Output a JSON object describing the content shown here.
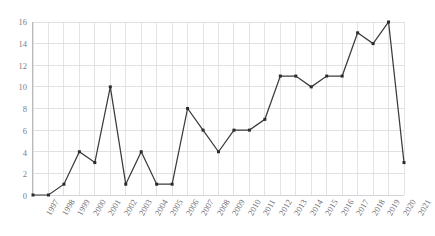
{
  "chart_data": {
    "type": "line",
    "title": "",
    "subtitle": "",
    "xlabel": "",
    "ylabel": "",
    "categories": [
      "1997",
      "1998",
      "1999",
      "2000",
      "2001",
      "2002",
      "2003",
      "2004",
      "2005",
      "2006",
      "2007",
      "2008",
      "2009",
      "2010",
      "2011",
      "2012",
      "2013",
      "2014",
      "2015",
      "2016",
      "2017",
      "2018",
      "2019",
      "2020",
      "2021"
    ],
    "values": [
      0,
      0,
      1,
      4,
      3,
      10,
      1,
      4,
      1,
      1,
      8,
      6,
      4,
      6,
      6,
      7,
      11,
      11,
      10,
      11,
      11,
      15,
      14,
      16,
      3
    ],
    "series": [
      {
        "name": "",
        "values": [
          0,
          0,
          1,
          4,
          3,
          10,
          1,
          4,
          1,
          1,
          8,
          6,
          4,
          6,
          6,
          7,
          11,
          11,
          10,
          11,
          11,
          15,
          14,
          16,
          3
        ]
      }
    ],
    "ylim": [
      0,
      16
    ],
    "ytick_step": 2,
    "ytick_labels": [
      "0",
      "2",
      "4",
      "6",
      "8",
      "10",
      "12",
      "14",
      "16"
    ],
    "xlim": [
      "1997",
      "2021"
    ],
    "grid": true,
    "grid_axes": "both",
    "legend": false,
    "legend_position": "none",
    "markers": true,
    "line_color": "#3b3b3b",
    "grid_color": "#d9d9de",
    "axis_color": "#b9b9bd",
    "tick_label_color": "#6f6f76",
    "background_color": "#ffffff",
    "xtick_rotation_degrees": -60
  }
}
